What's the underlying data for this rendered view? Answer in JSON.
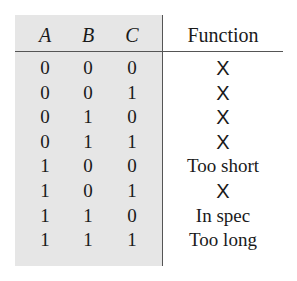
{
  "table": {
    "headers": [
      "A",
      "B",
      "C",
      "Function"
    ],
    "rows": [
      {
        "A": "0",
        "B": "0",
        "C": "0",
        "Function": "X"
      },
      {
        "A": "0",
        "B": "0",
        "C": "1",
        "Function": "X"
      },
      {
        "A": "0",
        "B": "1",
        "C": "0",
        "Function": "X"
      },
      {
        "A": "0",
        "B": "1",
        "C": "1",
        "Function": "X"
      },
      {
        "A": "1",
        "B": "0",
        "C": "0",
        "Function": "Too short"
      },
      {
        "A": "1",
        "B": "0",
        "C": "1",
        "Function": "X"
      },
      {
        "A": "1",
        "B": "1",
        "C": "0",
        "Function": "In spec"
      },
      {
        "A": "1",
        "B": "1",
        "C": "1",
        "Function": "Too long"
      }
    ]
  },
  "colors": {
    "input_shade": "#e6e6e6",
    "rule": "#555555",
    "text": "#1a1a1a"
  }
}
